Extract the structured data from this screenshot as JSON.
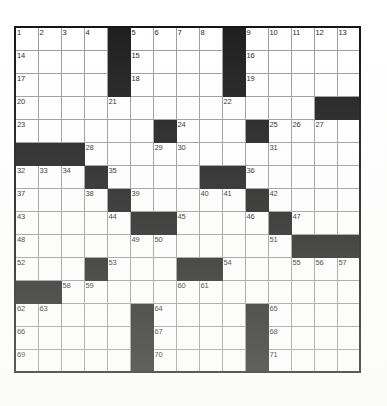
{
  "puzzle": {
    "title": "Crossword Grid",
    "rows": 15,
    "cols": 15,
    "cell_size_px": 23,
    "colors": {
      "block": "#1a1a1a",
      "cell": "#ffffff",
      "grid_line": "#9a9a9a",
      "border": "#111111",
      "number_text": "#1c1c1c"
    },
    "max_clue_number": 71,
    "grid": [
      [
        "1",
        "2",
        "3",
        "4",
        "#",
        "5",
        "6",
        "7",
        "8",
        "#",
        "9",
        "10",
        "11",
        "12",
        "13"
      ],
      [
        "14",
        "",
        "",
        "",
        "#",
        "15",
        "",
        "",
        "",
        "#",
        "16",
        "",
        "",
        "",
        ""
      ],
      [
        "17",
        "",
        "",
        "",
        "#",
        "18",
        "",
        "",
        "",
        "#",
        "19",
        "",
        "",
        "",
        ""
      ],
      [
        "20",
        "",
        "",
        "",
        "21",
        "",
        "",
        "",
        "",
        "22",
        "",
        "",
        "",
        "#",
        "#"
      ],
      [
        "23",
        "",
        "",
        "",
        "",
        "",
        "#",
        "24",
        "",
        "",
        "#",
        "25",
        "26",
        "27",
        ""
      ],
      [
        "#",
        "#",
        "#",
        "28",
        "",
        "",
        "29",
        "30",
        "",
        "",
        "",
        "31",
        "",
        "",
        ""
      ],
      [
        "32",
        "33",
        "34",
        "#",
        "35",
        "",
        "",
        "",
        "#",
        "#",
        "36",
        "",
        "",
        "",
        ""
      ],
      [
        "37",
        "",
        "",
        "38",
        "#",
        "39",
        "",
        "",
        "40",
        "41",
        "#",
        "42",
        "",
        "",
        ""
      ],
      [
        "43",
        "",
        "",
        "",
        "44",
        "#",
        "#",
        "45",
        "",
        "",
        "46",
        "#",
        "47",
        "",
        ""
      ],
      [
        "48",
        "",
        "",
        "",
        "",
        "49",
        "50",
        "",
        "",
        "",
        "",
        "51",
        "#",
        "#",
        "#"
      ],
      [
        "52",
        "",
        "",
        "#",
        "53",
        "",
        "",
        "#",
        "#",
        "54",
        "",
        "",
        "55",
        "56",
        "57"
      ],
      [
        "#",
        "#",
        "58",
        "59",
        "",
        "",
        "",
        "60",
        "61",
        "",
        "",
        "",
        "",
        "",
        ""
      ],
      [
        "62",
        "63",
        "",
        "",
        "",
        "#",
        "64",
        "",
        "",
        "",
        "#",
        "65",
        "",
        "",
        ""
      ],
      [
        "66",
        "",
        "",
        "",
        "",
        "#",
        "67",
        "",
        "",
        "",
        "#",
        "68",
        "",
        "",
        ""
      ],
      [
        "69",
        "",
        "",
        "",
        "",
        "#",
        "70",
        "",
        "",
        "",
        "#",
        "71",
        "",
        "",
        ""
      ]
    ]
  }
}
